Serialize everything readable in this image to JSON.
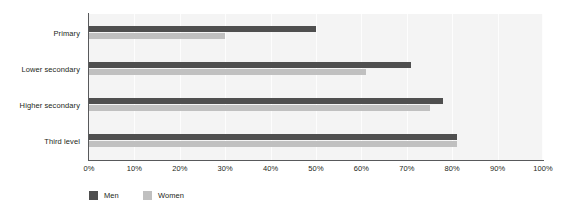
{
  "chart_data": {
    "type": "bar",
    "orientation": "horizontal",
    "title": "",
    "subtitle": "",
    "xlabel": "",
    "ylabel": "",
    "categories": [
      "Primary",
      "Lower secondary",
      "Higher secondary",
      "Third level"
    ],
    "series": [
      {
        "name": "Men",
        "color": "#4f4f4f",
        "values": [
          50,
          71,
          78,
          81
        ]
      },
      {
        "name": "Women",
        "color": "#c0c0c0",
        "values": [
          30,
          61,
          75,
          81
        ]
      }
    ],
    "xlim": [
      0,
      100
    ],
    "xticks": [
      0,
      10,
      20,
      30,
      40,
      50,
      60,
      70,
      80,
      90,
      100
    ],
    "xticklabels": [
      "0%",
      "10%",
      "20%",
      "30%",
      "40%",
      "50%",
      "60%",
      "70%",
      "80%",
      "90%",
      "100%"
    ],
    "grid": "vertical",
    "legend_position": "bottom-left",
    "plot_background": "#f4f4f4",
    "axis_color": "#58595b",
    "text_color": "#231f20"
  },
  "legend": {
    "items": [
      {
        "label": "Men"
      },
      {
        "label": "Women"
      }
    ]
  }
}
